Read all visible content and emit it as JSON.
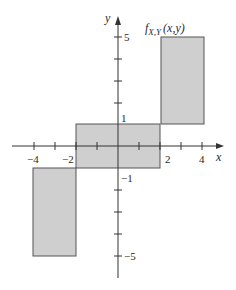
{
  "diagram": {
    "function_label": "f",
    "function_subscript": "X,Y",
    "function_args": "(x,y)",
    "x_axis_label": "x",
    "y_axis_label": "y",
    "x_tick_labels": [
      "−4",
      "−2",
      "2",
      "4"
    ],
    "y_tick_labels": [
      "5",
      "1",
      "−1",
      "−5"
    ],
    "colors": {
      "region_fill": "#cfcfcf",
      "region_stroke": "#555555",
      "axis": "#333333"
    },
    "regions": [
      {
        "name": "center",
        "x": [
          -2,
          2
        ],
        "y": [
          -1,
          1
        ]
      },
      {
        "name": "upper-right",
        "x": [
          2,
          4
        ],
        "y": [
          1,
          5
        ]
      },
      {
        "name": "lower-left",
        "x": [
          -4,
          -2
        ],
        "y": [
          -5,
          -1
        ]
      }
    ]
  }
}
